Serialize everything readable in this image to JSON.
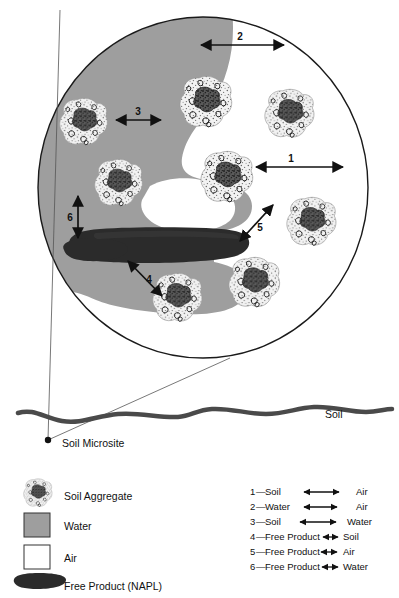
{
  "figure": {
    "colors": {
      "water": "#9e9e9e",
      "air": "#ffffff",
      "napl": "#2b2b2b",
      "outline": "#1a1a1a",
      "soil_line": "#4a4a4a",
      "aggregate_fill": "#efefef",
      "aggregate_speck": "#555555"
    }
  },
  "microsite": {
    "label": "Soil Microsite",
    "dot_label": "",
    "arrows": [
      {
        "id": "1",
        "label": "1"
      },
      {
        "id": "2",
        "label": "2"
      },
      {
        "id": "3",
        "label": "3"
      },
      {
        "id": "4",
        "label": "4"
      },
      {
        "id": "5",
        "label": "5"
      },
      {
        "id": "6",
        "label": "6"
      }
    ]
  },
  "soil_profile": {
    "label": "Soil"
  },
  "legend_symbols": {
    "title": "",
    "items": [
      {
        "key": "soil-aggregate",
        "label": "Soil Aggregate",
        "swatch": "aggregate"
      },
      {
        "key": "water",
        "label": "Water",
        "swatch": "gray-square"
      },
      {
        "key": "air",
        "label": "Air",
        "swatch": "white-square"
      },
      {
        "key": "free-product",
        "label": "Free Product (NAPL)",
        "swatch": "napl-blob"
      }
    ]
  },
  "legend_interfaces": {
    "items": [
      {
        "number": "1",
        "dash": "—",
        "left": "Soil",
        "right": "Air",
        "style": "wide"
      },
      {
        "number": "2",
        "dash": "—",
        "left": "Water",
        "right": "Air",
        "style": "wide"
      },
      {
        "number": "3",
        "dash": "—",
        "left": "Soil",
        "right": "Water",
        "style": "wide"
      },
      {
        "number": "4",
        "dash": "—",
        "left": "Free Product",
        "right": "Soil",
        "style": "narrow"
      },
      {
        "number": "5",
        "dash": "—",
        "left": "Free Product",
        "right": "Air",
        "style": "narrow"
      },
      {
        "number": "6",
        "dash": "—",
        "left": "Free Product",
        "right": "Water",
        "style": "narrow"
      }
    ]
  }
}
